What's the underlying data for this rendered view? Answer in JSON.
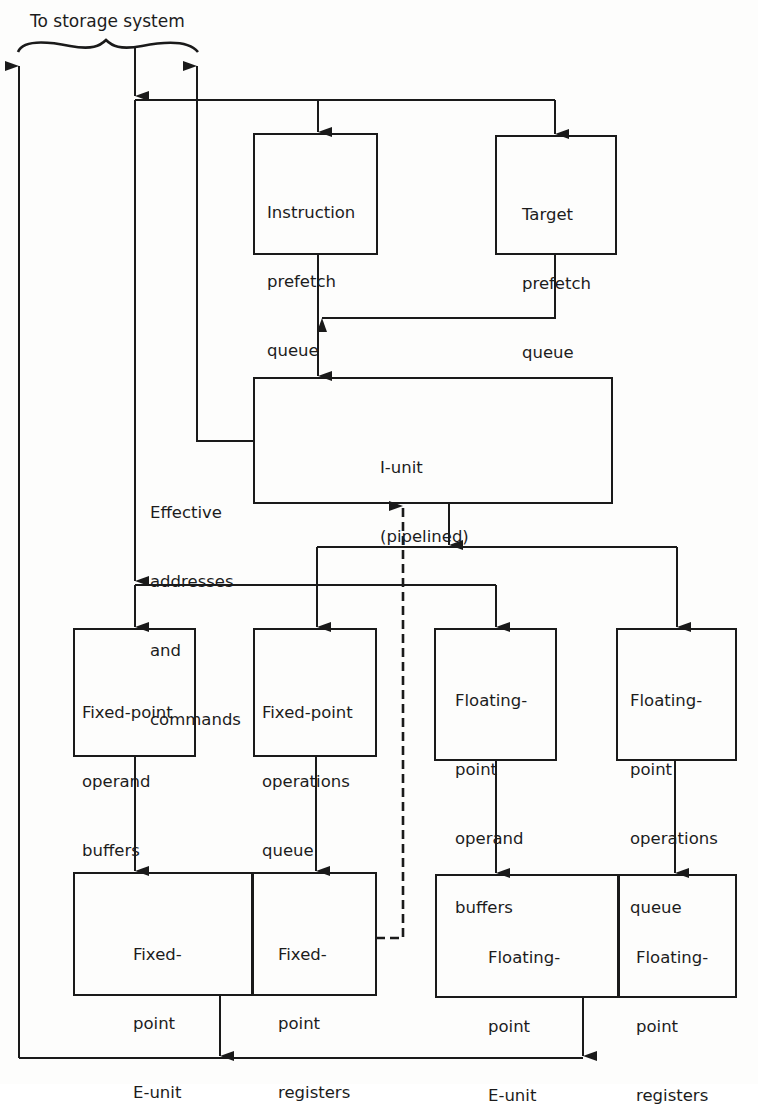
{
  "diagram": {
    "title_label": "To storage system",
    "side_label": [
      "Effective",
      "addresses",
      "and",
      "commands"
    ],
    "boxes": {
      "instruction_prefetch": {
        "lines": [
          "Instruction",
          "prefetch",
          "queue"
        ]
      },
      "target_prefetch": {
        "lines": [
          "Target",
          "prefetch",
          "queue"
        ]
      },
      "i_unit": {
        "lines": [
          "I-unit",
          "(pipelined)"
        ]
      },
      "fixed_operand_buffers": {
        "lines": [
          "Fixed-point",
          "operand",
          "buffers"
        ]
      },
      "fixed_operations_queue": {
        "lines": [
          "Fixed-point",
          "operations",
          "queue"
        ]
      },
      "float_operand_buffers": {
        "lines": [
          "Floating-",
          "point",
          "operand",
          "buffers"
        ]
      },
      "float_operations_queue": {
        "lines": [
          "Floating-",
          "point",
          "operations",
          "queue"
        ]
      },
      "fixed_e_unit": {
        "lines": [
          "Fixed-",
          "point",
          "E-unit"
        ]
      },
      "fixed_registers": {
        "lines": [
          "Fixed-",
          "point",
          "registers"
        ]
      },
      "float_e_unit": {
        "lines": [
          "Floating-",
          "point",
          "E-unit"
        ]
      },
      "float_registers": {
        "lines": [
          "Floating-",
          "point",
          "registers"
        ]
      }
    },
    "colors": {
      "ink": "#1a1a1a",
      "paper": "#fdfdfc"
    }
  }
}
